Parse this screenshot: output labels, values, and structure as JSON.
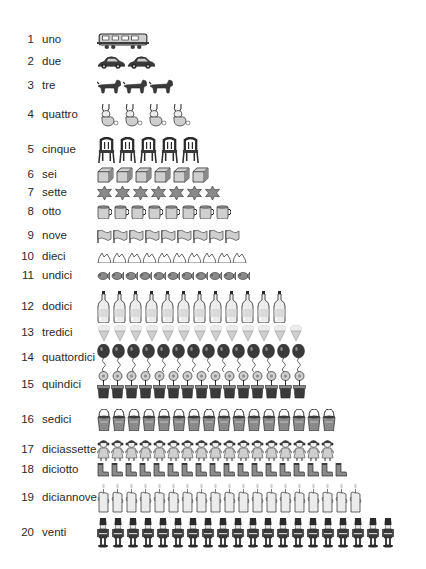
{
  "worksheet": {
    "rows": [
      {
        "number": "1",
        "word": "uno",
        "item": "train-car",
        "count": 1,
        "y": 40,
        "h": 18,
        "w": 52,
        "gap": 0
      },
      {
        "number": "2",
        "word": "due",
        "item": "car",
        "count": 2,
        "y": 62,
        "h": 14,
        "w": 28,
        "gap": 2
      },
      {
        "number": "3",
        "word": "tre",
        "item": "dog",
        "count": 3,
        "y": 86,
        "h": 16,
        "w": 24,
        "gap": 2
      },
      {
        "number": "4",
        "word": "quattro",
        "item": "rabbit",
        "count": 4,
        "y": 115,
        "h": 24,
        "w": 22,
        "gap": 2
      },
      {
        "number": "5",
        "word": "cinque",
        "item": "chair",
        "count": 5,
        "y": 150,
        "h": 26,
        "w": 19,
        "gap": 2
      },
      {
        "number": "6",
        "word": "sei",
        "item": "cube",
        "count": 6,
        "y": 175,
        "h": 16,
        "w": 17,
        "gap": 2
      },
      {
        "number": "7",
        "word": "sette",
        "item": "star",
        "count": 7,
        "y": 193,
        "h": 14,
        "w": 15,
        "gap": 3
      },
      {
        "number": "8",
        "word": "otto",
        "item": "mug",
        "count": 8,
        "y": 212,
        "h": 14,
        "w": 15,
        "gap": 2
      },
      {
        "number": "9",
        "word": "nove",
        "item": "flag",
        "count": 9,
        "y": 236,
        "h": 14,
        "w": 15,
        "gap": 1
      },
      {
        "number": "10",
        "word": "dieci",
        "item": "paper-boat",
        "count": 10,
        "y": 257,
        "h": 12,
        "w": 15,
        "gap": 0
      },
      {
        "number": "11",
        "word": "undici",
        "item": "fish",
        "count": 11,
        "y": 276,
        "h": 10,
        "w": 13,
        "gap": 1
      },
      {
        "number": "12",
        "word": "dodici",
        "item": "bottle",
        "count": 12,
        "y": 307,
        "h": 32,
        "w": 13,
        "gap": 3
      },
      {
        "number": "13",
        "word": "tredici",
        "item": "ice-cream-cone",
        "count": 13,
        "y": 333,
        "h": 16,
        "w": 13,
        "gap": 3
      },
      {
        "number": "14",
        "word": "quattordici",
        "item": "balloon",
        "count": 14,
        "y": 358,
        "h": 28,
        "w": 13,
        "gap": 2
      },
      {
        "number": "15",
        "word": "quindici",
        "item": "flower-pot",
        "count": 15,
        "y": 385,
        "h": 28,
        "w": 13,
        "gap": 1
      },
      {
        "number": "16",
        "word": "sedici",
        "item": "bucket",
        "count": 16,
        "y": 420,
        "h": 22,
        "w": 14,
        "gap": 1
      },
      {
        "number": "17",
        "word": "diciassette",
        "item": "doll",
        "count": 17,
        "y": 450,
        "h": 22,
        "w": 13,
        "gap": 1
      },
      {
        "number": "18",
        "word": "diciotto",
        "item": "boot",
        "count": 18,
        "y": 470,
        "h": 14,
        "w": 12,
        "gap": 2
      },
      {
        "number": "19",
        "word": "diciannove",
        "item": "candle",
        "count": 19,
        "y": 498,
        "h": 30,
        "w": 13,
        "gap": 1
      },
      {
        "number": "20",
        "word": "venti",
        "item": "toy-soldier",
        "count": 20,
        "y": 533,
        "h": 30,
        "w": 12,
        "gap": 3
      }
    ]
  },
  "colors": {
    "ink": "#2a2a2a",
    "dark_fill": "#3a3a3a",
    "mid_fill": "#8a8a8a",
    "light_fill": "#cfcfcf",
    "pale_fill": "#ececec",
    "background": "#ffffff"
  }
}
